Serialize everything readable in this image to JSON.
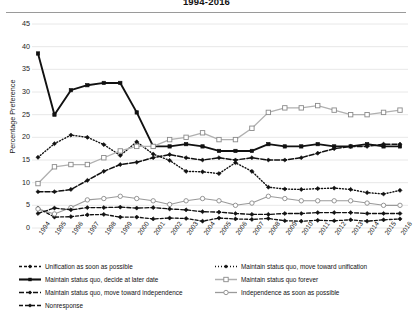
{
  "chart_data": {
    "type": "line",
    "title": "1994-2016",
    "xlabel": "",
    "ylabel": "Percentage Preference",
    "ylim": [
      0,
      45
    ],
    "yticks": [
      0,
      5,
      10,
      15,
      20,
      25,
      30,
      35,
      40,
      45
    ],
    "grid": "horizontal",
    "legend_position": "bottom",
    "categories": [
      "1994",
      "1995",
      "1996",
      "1997",
      "1998",
      "1999",
      "2000",
      "2001",
      "2002",
      "2003",
      "2004",
      "2005",
      "2006",
      "2007",
      "2008",
      "2009",
      "2010",
      "2011",
      "2012",
      "2013",
      "2014",
      "2015",
      "2016"
    ],
    "series": [
      {
        "name": "Unification as soon as possible",
        "key": "unification-asap",
        "marker": "diamond",
        "color": "#111111",
        "dash": "3 2",
        "width": 1.3,
        "values": [
          4.4,
          2.4,
          2.5,
          2.9,
          3.0,
          2.4,
          2.4,
          2.0,
          2.2,
          2.1,
          1.5,
          2.2,
          2.0,
          1.9,
          2.1,
          1.6,
          1.5,
          1.7,
          1.6,
          1.8,
          1.5,
          1.8,
          2.0
        ]
      },
      {
        "name": "Maintain status quo, move toward unification",
        "key": "msq-toward-unification",
        "marker": "diamond",
        "color": "#111111",
        "dash": "1 2",
        "width": 1.4,
        "values": [
          15.6,
          18.6,
          20.5,
          20.0,
          18.4,
          16.0,
          19.0,
          16.3,
          14.9,
          12.5,
          12.4,
          12.0,
          14.4,
          12.5,
          9.0,
          8.6,
          8.5,
          8.7,
          8.8,
          8.5,
          7.8,
          7.5,
          8.3
        ]
      },
      {
        "name": "Maintain status quo, decide at later date",
        "key": "msq-decide-later",
        "marker": "square",
        "color": "#111111",
        "dash": "none",
        "width": 1.9,
        "values": [
          38.5,
          25.0,
          30.4,
          31.5,
          32.0,
          32.0,
          25.5,
          18.0,
          18.0,
          18.5,
          18.0,
          17.0,
          17.0,
          17.0,
          18.5,
          18.0,
          18.0,
          18.5,
          18.0,
          18.0,
          18.5,
          18.0,
          18.0
        ]
      },
      {
        "name": "Maintain status quo forever",
        "key": "msq-forever",
        "marker": "square-open",
        "color": "#b0b0b0",
        "dash": "none",
        "width": 1.3,
        "values": [
          9.8,
          13.5,
          14.0,
          14.0,
          15.5,
          17.0,
          18.0,
          18.0,
          19.5,
          20.0,
          21.0,
          19.5,
          19.5,
          22.0,
          25.5,
          26.5,
          26.5,
          27.0,
          26.0,
          25.0,
          25.0,
          25.5,
          26.0
        ]
      },
      {
        "name": "Maintain status quo, move toward independence",
        "key": "msq-toward-independence",
        "marker": "diamond",
        "color": "#111111",
        "dash": "5 2",
        "width": 1.5,
        "values": [
          8.0,
          8.0,
          8.5,
          10.5,
          12.5,
          14.0,
          14.5,
          15.5,
          16.2,
          15.5,
          15.0,
          15.5,
          15.0,
          15.5,
          15.0,
          15.0,
          15.5,
          16.5,
          17.5,
          18.0,
          18.0,
          18.5,
          18.5
        ]
      },
      {
        "name": "Independence as soon as possible",
        "key": "independence-asap",
        "marker": "circle-open",
        "color": "#9a9a9a",
        "dash": "none",
        "width": 1.1,
        "values": [
          4.2,
          3.1,
          4.5,
          6.2,
          6.5,
          7.0,
          6.5,
          6.0,
          5.2,
          6.0,
          6.5,
          6.0,
          5.0,
          5.5,
          7.0,
          6.5,
          6.0,
          6.0,
          6.0,
          6.0,
          5.5,
          5.0,
          5.0
        ]
      },
      {
        "name": "Nonresponse",
        "key": "nonresponse",
        "marker": "diamond",
        "color": "#111111",
        "dash": "4 2",
        "width": 1.3,
        "values": [
          3.2,
          4.4,
          4.0,
          4.5,
          4.5,
          4.6,
          4.4,
          4.5,
          4.2,
          4.0,
          3.6,
          3.5,
          3.2,
          3.0,
          3.0,
          3.2,
          3.2,
          3.4,
          3.4,
          3.4,
          3.2,
          3.2,
          3.2
        ]
      }
    ]
  },
  "legend": {
    "items": [
      {
        "label": "Unification as soon as possible"
      },
      {
        "label": "Maintain status quo, move toward unification"
      },
      {
        "label": "Maintain status quo, decide at later date"
      },
      {
        "label": "Maintain status quo forever"
      },
      {
        "label": "Maintain status quo, move toward independence"
      },
      {
        "label": "Independence as soon as possible"
      },
      {
        "label": "Nonresponse"
      }
    ]
  }
}
